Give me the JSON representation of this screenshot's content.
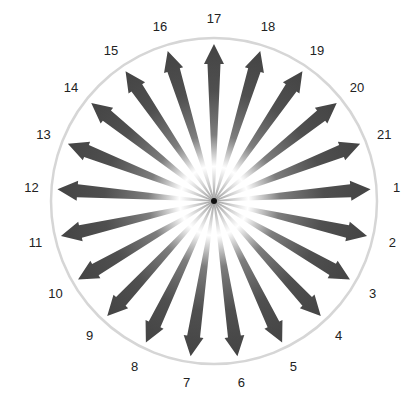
{
  "diagram": {
    "type": "radial-arrow-wheel",
    "center": [
      214,
      201
    ],
    "circle_radius": 163,
    "arrow_tip_radius": 157,
    "label_radius": 183,
    "start_angle_deg": -4.29,
    "count": 21,
    "labels": [
      "1",
      "2",
      "3",
      "4",
      "5",
      "6",
      "7",
      "8",
      "9",
      "10",
      "11",
      "12",
      "13",
      "14",
      "15",
      "16",
      "17",
      "18",
      "19",
      "20",
      "21"
    ],
    "colors": {
      "arrow_dark": "#4a4a4a",
      "arrow_light": "#f2f2f2",
      "circle": "#d6d6d6",
      "label": "#222222",
      "hub": "#111111"
    }
  }
}
